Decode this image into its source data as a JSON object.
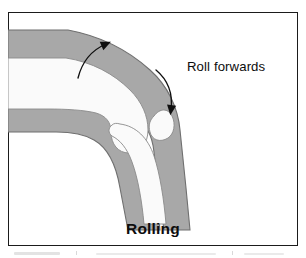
{
  "figure": {
    "caption": "Rolling",
    "annotation_label": "Roll forwards",
    "colors": {
      "frame_border": "#1b1b1b",
      "background": "#ffffff",
      "bone_fill": "#a8a8a8",
      "bone_outline": "#6f6f6f",
      "marrow_fill": "#fafafa",
      "arrow_stroke": "#101010",
      "text": "#0d0d0d"
    },
    "diagram": {
      "type": "anatomical-illustration",
      "subject": "knee-joint-sagittal",
      "parts": [
        {
          "name": "femur",
          "description": "upper bone entering from left, curving down to condyle"
        },
        {
          "name": "femoral-condyle",
          "description": "rounded articular end of femur"
        },
        {
          "name": "tibia",
          "description": "lower bone descending from joint"
        },
        {
          "name": "marrow-cavity",
          "description": "white interior channels within both bones"
        }
      ],
      "arrows": [
        {
          "name": "femur-rotation-arrow",
          "direction": "up-right",
          "description": "curved arrow over femoral shaft indicating rotation"
        },
        {
          "name": "condyle-roll-arrow",
          "direction": "down",
          "description": "curved arrow tracing the condyle surface indicating forward roll"
        }
      ]
    }
  }
}
